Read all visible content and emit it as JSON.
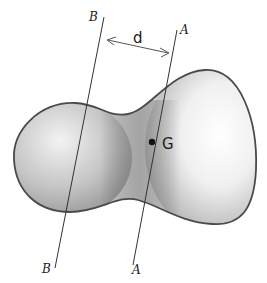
{
  "diagram": {
    "labels": {
      "axis_b_top": "B",
      "axis_a_top": "A",
      "axis_b_bottom": "B",
      "axis_a_bottom": "A",
      "distance": "d",
      "centroid": "G"
    },
    "colors": {
      "outline": "#4a4a4a",
      "shade_dark": "#8a8a8a",
      "shade_light": "#f2f2f2",
      "line": "#333333",
      "background": "#ffffff"
    }
  }
}
